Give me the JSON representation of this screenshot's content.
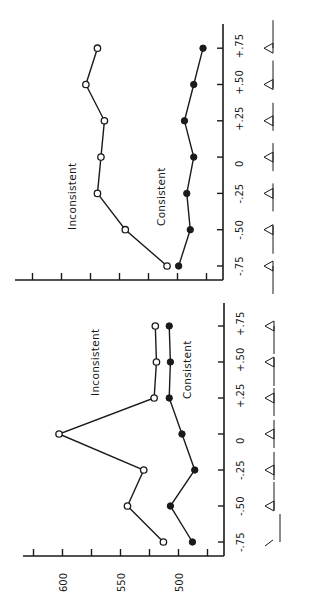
{
  "chart_data": [
    {
      "type": "line",
      "title": "",
      "orientation": "rotated 90deg counter-clockwise (x-axis runs vertically, RT axis horizontally)",
      "xlabel": "",
      "ylabel": "",
      "categories": [
        "-.75",
        "-.50",
        "-.25",
        "0",
        "+.25",
        "+.50",
        "+.75"
      ],
      "x": [
        -0.75,
        -0.5,
        -0.25,
        0,
        0.25,
        0.5,
        0.75
      ],
      "ylim": [
        462,
        635
      ],
      "yticks": [
        475,
        500,
        525,
        550,
        575,
        600,
        625
      ],
      "ytick_labels": [],
      "series": [
        {
          "name": "Inconsistent",
          "marker": "open-circle",
          "values": [
            509,
            545,
            569,
            566,
            563,
            579,
            569
          ]
        },
        {
          "name": "Consistent",
          "marker": "filled-circle",
          "values": [
            499,
            489,
            492,
            486,
            494,
            486,
            478
          ]
        }
      ],
      "icons": [
        "triangle-on-line",
        "triangle-on-line",
        "triangle-on-line",
        "triangle-on-line",
        "triangle-on-line",
        "triangle-on-line",
        "triangle-on-line"
      ],
      "legend": "inline labels",
      "grid": false
    },
    {
      "type": "line",
      "title": "",
      "orientation": "rotated 90deg counter-clockwise (x-axis runs vertically, RT axis horizontally)",
      "xlabel": "",
      "ylabel": "",
      "categories": [
        "-.75",
        "-.50",
        "-.25",
        "0",
        "+.25",
        "+.50",
        "+.75"
      ],
      "x": [
        -0.75,
        -0.5,
        -0.25,
        0,
        0.25,
        0.5,
        0.75
      ],
      "ylim": [
        462,
        635
      ],
      "yticks": [
        475,
        500,
        525,
        550,
        575,
        600,
        625
      ],
      "ytick_labels": [
        "500",
        "550",
        "600"
      ],
      "series": [
        {
          "name": "Inconsistent",
          "marker": "open-circle",
          "values": [
            513,
            544,
            530,
            603,
            521,
            519,
            520
          ]
        },
        {
          "name": "Consistent",
          "marker": "filled-circle",
          "values": [
            488,
            507,
            486,
            497,
            508,
            507,
            508
          ]
        }
      ],
      "icons": [
        "tilted-line",
        "triangle-on-line",
        "triangle-on-line",
        "triangle-on-line",
        "triangle-on-line",
        "triangle-on-line",
        "triangle-on-line"
      ],
      "legend": "inline labels",
      "grid": false
    }
  ],
  "panels": {
    "top": {
      "labels": {
        "inconsistent": "Inconsistent",
        "consistent": "Consistent"
      },
      "x_tick_labels": [
        "-.75",
        "-.50",
        "-.25",
        "0",
        "+.25",
        "+.50",
        "+.75"
      ]
    },
    "bottom": {
      "labels": {
        "inconsistent": "Inconsistent",
        "consistent": "Consistent"
      },
      "x_tick_labels": [
        "-.75",
        "-.50",
        "-.25",
        "0",
        "+.25",
        "+.50",
        "+.75"
      ],
      "y_tick_labels": [
        "500",
        "550",
        "600"
      ]
    }
  },
  "colors": {
    "ink": "#1a1a1a",
    "background": "#ffffff"
  }
}
